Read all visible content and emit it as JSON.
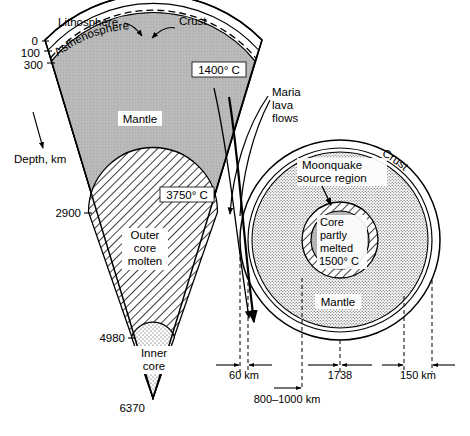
{
  "figure": {
    "title_visible": false
  },
  "earth": {
    "layers": {
      "crust_label": "Crust",
      "lithosphere_label": "Lithosphere",
      "asthenosphere_label": "Asthenosphere",
      "mantle_label": "Mantle",
      "outer_core_label_line1": "Outer",
      "outer_core_label_line2": "core",
      "outer_core_label_line3": "molten",
      "inner_core_label_line1": "Inner",
      "inner_core_label_line2": "core"
    },
    "axis_label": "Depth,  km",
    "depth_ticks": [
      "0",
      "100",
      "300",
      "2900",
      "4980",
      "6370"
    ],
    "temperatures": [
      "1400° C",
      "3750° C"
    ]
  },
  "moon": {
    "crust_label": "Crust",
    "mantle_label": "Mantle",
    "moonquake_label_line1": "Moonquake",
    "moonquake_label_line2": "source  region",
    "core_label_line1": "Core",
    "core_label_line2": "partly",
    "core_label_line3": "melted",
    "core_label_line4": "1500° C",
    "maria_label_line1": "Maria",
    "maria_label_line2": "lava",
    "maria_label_line3": "flows",
    "dimensions": {
      "crust_thickness": "60 km",
      "radius": "1738",
      "core_zone": "150 km",
      "moonquake_depth": "800–1000 km"
    }
  },
  "colors": {
    "ink": "#000000",
    "mantle_fill": "#b9b9b9",
    "core_fill": "#b3b3b3",
    "stipple_light": "#e8e8e8",
    "paper": "#ffffff"
  }
}
